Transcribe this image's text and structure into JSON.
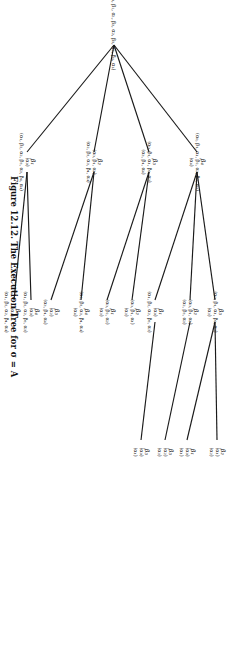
{
  "figure": {
    "caption_label": "Figure 12.12.",
    "caption_text": "The Execution Tree for σ = A"
  },
  "tree": {
    "root": {
      "id": "root",
      "op": "",
      "seq_top": "",
      "seq_bottom": "(α₀, β₁, α₁, β₂, α₂, β₃, α₃, β₄, α₄)"
    },
    "nodes": [
      {
        "id": "b1",
        "op": "β₁",
        "seq_top": "(α₀)",
        "seq_bottom": "(α₁, β₂, α₂, β₃, α₃, β₄, α₄)"
      },
      {
        "id": "b2",
        "op": "β₂",
        "seq_top": "(α₀, β₁, α₁)",
        "seq_bottom": "(α₂, β₃, α₃, β₄, α₄)"
      },
      {
        "id": "b3",
        "op": "β₃",
        "seq_top": "(α₀, β₁, α₁, β₂, α₂)",
        "seq_bottom": "(α₃, β₄, α₄)"
      },
      {
        "id": "b4",
        "op": "β₄",
        "seq_top": "(α₀, β₁, α₁, β₂, α₂, β₃, α₃)",
        "seq_bottom": "(α₄)"
      },
      {
        "id": "b1b2",
        "op": "β₂",
        "seq_top": "(α₀)",
        "seq_bottom": "(α₁, β₃, α₃, β₄, α₄)"
      },
      {
        "id": "b1b3",
        "op": "β₃",
        "seq_top": "(α₀)",
        "seq_bottom": "(α₁, β₂, α₂, β₄, α₄)"
      },
      {
        "id": "b1b4",
        "op": "β₄",
        "seq_top": "(α₀)",
        "seq_bottom": "(α₁, β₂, α₂, β₃, α₃)"
      },
      {
        "id": "b2b3",
        "op": "β₃",
        "seq_top": "(α₂)",
        "seq_bottom": "(α₃, β₄, α₄)"
      },
      {
        "id": "b2b4",
        "op": "β₄",
        "seq_top": "(α₂, β₃, α₃, β₄, α₄)",
        "seq_bottom": "(α₄)"
      },
      {
        "id": "b3b1",
        "op": "β₁",
        "seq_top": "(α₀, β₂, α₂)",
        "seq_bottom": "(α₃)"
      },
      {
        "id": "b3b2",
        "op": "β₂",
        "seq_top": "(α₀, β₁, α₁)",
        "seq_bottom": "(α₃)"
      },
      {
        "id": "b3b4",
        "op": "β₄",
        "seq_top": "(α₀, β₁, α₁, β₂, α₂)",
        "seq_bottom": "(α₃)"
      },
      {
        "id": "b4b1",
        "op": "β₁",
        "seq_top": "(α₀)",
        "seq_bottom": "(α₁, β₂, α₂, β₃, α₃)"
      },
      {
        "id": "b4b2",
        "op": "β₂",
        "seq_top": "(α₀, β₁, α₁)",
        "seq_bottom": "(α₂, β₃, α₃)"
      },
      {
        "id": "b4b3",
        "op": "β₃",
        "seq_top": "(α₀, β₁, α₁, β₂, α₂)",
        "seq_bottom": "(α₃)"
      },
      {
        "id": "b4b1b2",
        "op": "β₂",
        "seq_top": "(α₀, β₁, α₁)",
        "seq_bottom": "(α₂)"
      },
      {
        "id": "b4b1b3",
        "op": "β₃",
        "seq_top": "(α₀)",
        "seq_bottom": "(α₁)"
      },
      {
        "id": "b4b2b1",
        "op": "β₁",
        "seq_top": "(α₀, β₁, α₁)",
        "seq_bottom": "(α₃)"
      },
      {
        "id": "b4b2b3",
        "op": "β₃",
        "seq_top": "(α₂)",
        "seq_bottom": "(α₃)"
      },
      {
        "id": "b4b3b1",
        "op": "β₁",
        "seq_top": "(α₀)",
        "seq_bottom": "(α₁)"
      },
      {
        "id": "b4b3b2",
        "op": "β₂",
        "seq_top": "(α₁)",
        "seq_bottom": "(α₂)"
      }
    ]
  }
}
